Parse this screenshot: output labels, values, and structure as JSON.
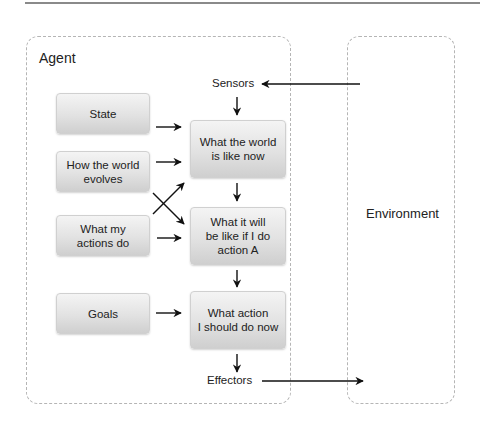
{
  "diagram": {
    "regions": {
      "agent": {
        "label": "Agent"
      },
      "environment": {
        "label": "Environment"
      }
    },
    "inputs": {
      "sensors": "Sensors",
      "effectors": "Effectors"
    },
    "left_boxes": [
      {
        "id": "state",
        "label": "State"
      },
      {
        "id": "world-evolves",
        "label": "How the world\nevolves"
      },
      {
        "id": "actions-do",
        "label": "What my\nactions do"
      },
      {
        "id": "goals",
        "label": "Goals"
      }
    ],
    "center_boxes": [
      {
        "id": "world-now",
        "label": "What the world\nis like now"
      },
      {
        "id": "if-action-a",
        "label": "What it will\nbe like if I do\naction A"
      },
      {
        "id": "action-now",
        "label": "What action\nI should do now"
      }
    ],
    "edges": [
      {
        "from": "Environment",
        "to": "Sensors"
      },
      {
        "from": "Sensors",
        "to": "What the world is like now"
      },
      {
        "from": "State",
        "to": "What the world is like now"
      },
      {
        "from": "How the world evolves",
        "to": "What the world is like now"
      },
      {
        "from": "What my actions do",
        "to": "What the world is like now"
      },
      {
        "from": "How the world evolves",
        "to": "What it will be like if I do action A"
      },
      {
        "from": "What my actions do",
        "to": "What it will be like if I do action A"
      },
      {
        "from": "What the world is like now",
        "to": "What it will be like if I do action A"
      },
      {
        "from": "What it will be like if I do action A",
        "to": "What action I should do now"
      },
      {
        "from": "Goals",
        "to": "What action I should do now"
      },
      {
        "from": "What action I should do now",
        "to": "Effectors"
      },
      {
        "from": "Effectors",
        "to": "Environment"
      }
    ],
    "colors": {
      "region_border": "#b5b5b5",
      "box_top": "#f4f4f4",
      "box_bottom": "#cfcfcf",
      "arrow": "#111111"
    }
  }
}
